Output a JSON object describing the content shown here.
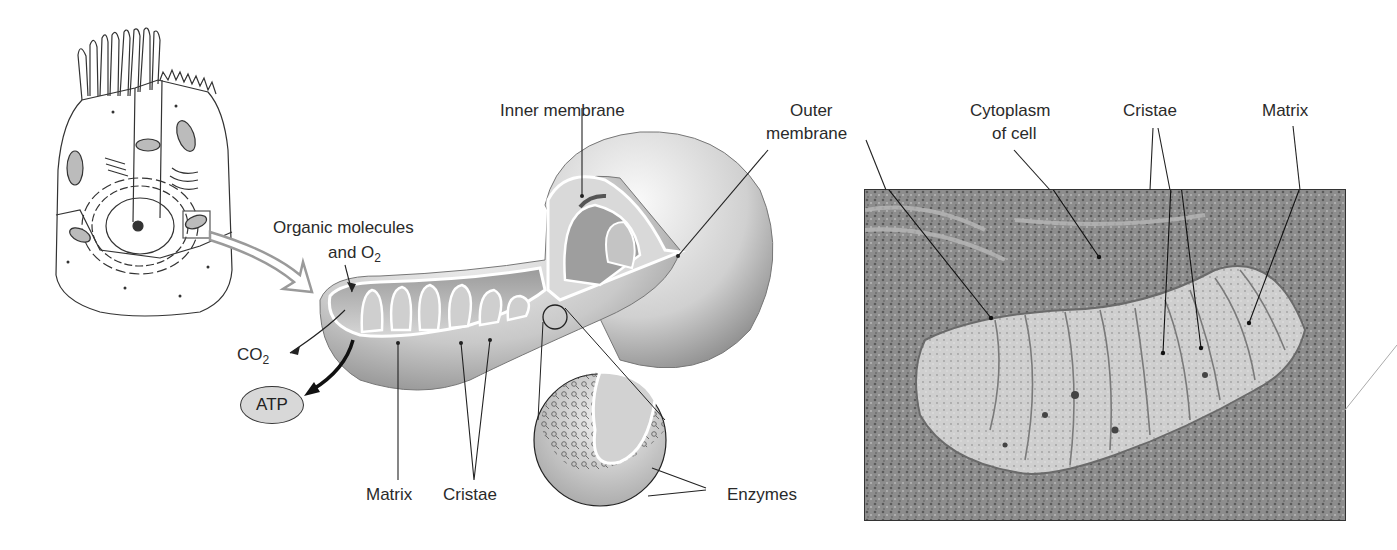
{
  "figure": {
    "panels": [
      {
        "id": "cell-drawing",
        "description": "Line drawing of an epithelial cell with a boxed mitochondrion"
      },
      {
        "id": "mitochondrion-illustration",
        "description": "3D cutaway of a mitochondrion with magnified inner membrane"
      },
      {
        "id": "electron-micrograph",
        "description": "TEM micrograph of a mitochondrion"
      }
    ],
    "illustration_labels": {
      "inner_membrane": "Inner membrane",
      "outer_membrane_line1": "Outer",
      "outer_membrane_line2": "membrane",
      "organic_line1": "Organic molecules",
      "organic_line2_prefix": "and O",
      "organic_line2_sub": "2",
      "co2_prefix": "CO",
      "co2_sub": "2",
      "atp": "ATP",
      "matrix": "Matrix",
      "cristae": "Cristae",
      "enzymes": "Enzymes"
    },
    "micrograph_labels": {
      "cytoplasm_line1": "Cytoplasm",
      "cytoplasm_line2": "of cell",
      "cristae": "Cristae",
      "matrix": "Matrix"
    }
  },
  "colors": {
    "line": "#2a2a2a",
    "arrow_outline": "#9a9a9a",
    "mito_light": "#f2f2f2",
    "mito_mid": "#bdbdbd",
    "mito_dark": "#7d7d7d",
    "micrograph_bg": "#8c8c8c"
  }
}
